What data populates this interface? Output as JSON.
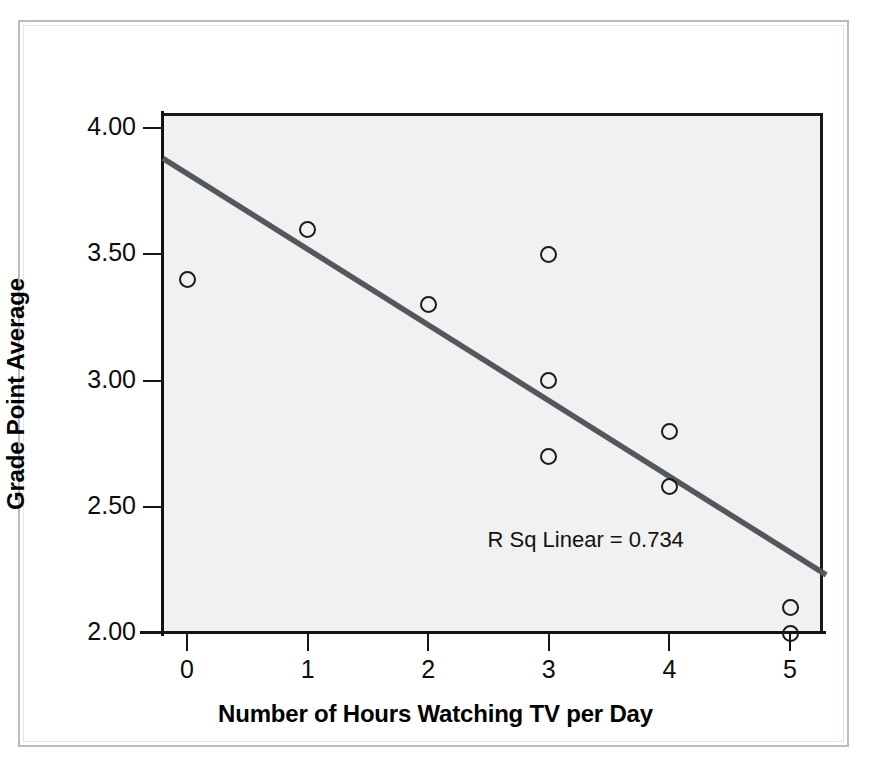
{
  "chart_data": {
    "type": "scatter",
    "title": "",
    "xlabel": "Number of Hours Watching TV per Day",
    "ylabel": "Grade Point Average",
    "xlim": [
      -0.2,
      5.3
    ],
    "ylim": [
      2.0,
      4.1
    ],
    "xticks": [
      0,
      1,
      2,
      3,
      4,
      5
    ],
    "xtick_labels": [
      "0",
      "1",
      "2",
      "3",
      "4",
      "5"
    ],
    "yticks": [
      2.0,
      2.5,
      3.0,
      3.5,
      4.0
    ],
    "ytick_labels": [
      "2.00",
      "2.50",
      "3.00",
      "3.50",
      "4.00"
    ],
    "grid": false,
    "legend": null,
    "points": [
      {
        "x": 0,
        "y": 3.4
      },
      {
        "x": 1,
        "y": 3.6
      },
      {
        "x": 2,
        "y": 3.3
      },
      {
        "x": 3,
        "y": 3.5
      },
      {
        "x": 3,
        "y": 3.0
      },
      {
        "x": 3,
        "y": 2.7
      },
      {
        "x": 4,
        "y": 2.8
      },
      {
        "x": 4,
        "y": 2.58
      },
      {
        "x": 5,
        "y": 2.1
      },
      {
        "x": 5,
        "y": 2.0
      }
    ],
    "fit_line": {
      "type": "linear",
      "x_start": -0.2,
      "y_start": 3.88,
      "x_end": 5.3,
      "y_end": 2.23,
      "color": "#52585e"
    },
    "annotations": [
      {
        "text": "R Sq Linear = 0.734",
        "x": 4.12,
        "y": 2.37
      }
    ],
    "marker_style": "open-circle",
    "marker_color": "#1b1b1b",
    "plot_background": "#f1f1f1"
  },
  "colors": {
    "page_background": "#ffffff",
    "frame_border": "#b9bcc0",
    "axis": "#121212",
    "text": "#0d0d0d",
    "fit_line": "#52585e",
    "plot_fill": "#f1f1f1"
  }
}
